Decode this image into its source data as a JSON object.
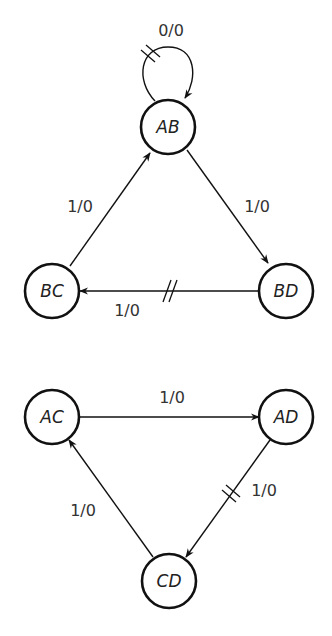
{
  "diagram": {
    "type": "state-transition-graph",
    "upper_graph": {
      "nodes": [
        {
          "id": "AB",
          "label": "AB"
        },
        {
          "id": "BC",
          "label": "BC"
        },
        {
          "id": "BD",
          "label": "BD"
        }
      ],
      "edges": [
        {
          "from": "AB",
          "to": "AB",
          "label": "0/0",
          "marked": true
        },
        {
          "from": "AB",
          "to": "BD",
          "label": "1/0",
          "marked": false
        },
        {
          "from": "BD",
          "to": "BC",
          "label": "1/0",
          "marked": true
        },
        {
          "from": "BC",
          "to": "AB",
          "label": "1/0",
          "marked": false
        }
      ]
    },
    "lower_graph": {
      "nodes": [
        {
          "id": "AC",
          "label": "AC"
        },
        {
          "id": "AD",
          "label": "AD"
        },
        {
          "id": "CD",
          "label": "CD"
        }
      ],
      "edges": [
        {
          "from": "AC",
          "to": "AD",
          "label": "1/0",
          "marked": false
        },
        {
          "from": "AD",
          "to": "CD",
          "label": "1/0",
          "marked": true
        },
        {
          "from": "CD",
          "to": "AC",
          "label": "1/0",
          "marked": false
        }
      ]
    }
  }
}
